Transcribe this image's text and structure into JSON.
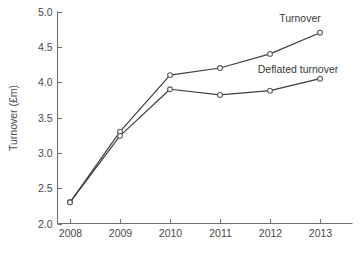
{
  "chart_data": {
    "type": "line",
    "title": "",
    "xlabel": "",
    "ylabel": "Turnover (£m)",
    "categories": [
      "2008",
      "2009",
      "2010",
      "2011",
      "2012",
      "2013"
    ],
    "x": [
      2008,
      2009,
      2010,
      2011,
      2012,
      2013
    ],
    "xlim": [
      2008,
      2013
    ],
    "ylim": [
      2.0,
      5.0
    ],
    "y_ticks": [
      "2.0",
      "2.5",
      "3.0",
      "3.5",
      "4.0",
      "4.5",
      "5.0"
    ],
    "y_tick_values": [
      2.0,
      2.5,
      3.0,
      3.5,
      4.0,
      4.5,
      5.0
    ],
    "x_ticks": [
      "2008",
      "2009",
      "2010",
      "2011",
      "2012",
      "2013"
    ],
    "grid": false,
    "legend_position": "inline-annotation",
    "series": [
      {
        "name": "Turnover",
        "values": [
          2.3,
          3.3,
          4.1,
          4.2,
          4.4,
          4.7
        ],
        "color": "#3c3c3c",
        "marker": "open-circle",
        "annotation": "Turnover"
      },
      {
        "name": "Deflated turnover",
        "values": [
          2.3,
          3.24,
          3.9,
          3.82,
          3.88,
          4.05
        ],
        "color": "#3c3c3c",
        "marker": "open-circle",
        "annotation": "Deflated turnover"
      }
    ],
    "annotations": [
      {
        "text": "Turnover",
        "x_px": 300,
        "y_px": 22
      },
      {
        "text": "Deflated turnover",
        "x_px": 298,
        "y_px": 73
      }
    ]
  },
  "colors": {
    "background": "#ffffff",
    "axis": "#6e6e6e",
    "line": "#3c3c3c",
    "marker_fill": "#ffffff",
    "marker_stroke": "#5a5a5a",
    "text": "#4a4a4a"
  }
}
